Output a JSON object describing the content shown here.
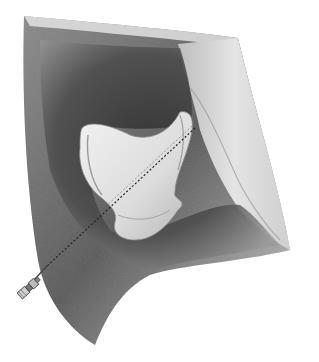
{
  "illustration": {
    "subject": "pencil-shaded anatomical illustration of a joint cavity with a bone-like structure and a needle inserted along a dotted path",
    "colors": {
      "background": "#ffffff",
      "tissue_dark": "#3a3a3a",
      "tissue_mid": "#7a7a7a",
      "tissue_light": "#d8d8d8",
      "bone": "#e6e6e6",
      "bone_shadow": "#a9a9a9",
      "needle": "#555555"
    },
    "elements": [
      {
        "name": "outer-tissue-wall"
      },
      {
        "name": "joint-cavity"
      },
      {
        "name": "bone-structure"
      },
      {
        "name": "right-ligament-fold"
      },
      {
        "name": "needle-path-dotted"
      },
      {
        "name": "needle-hub"
      }
    ]
  }
}
